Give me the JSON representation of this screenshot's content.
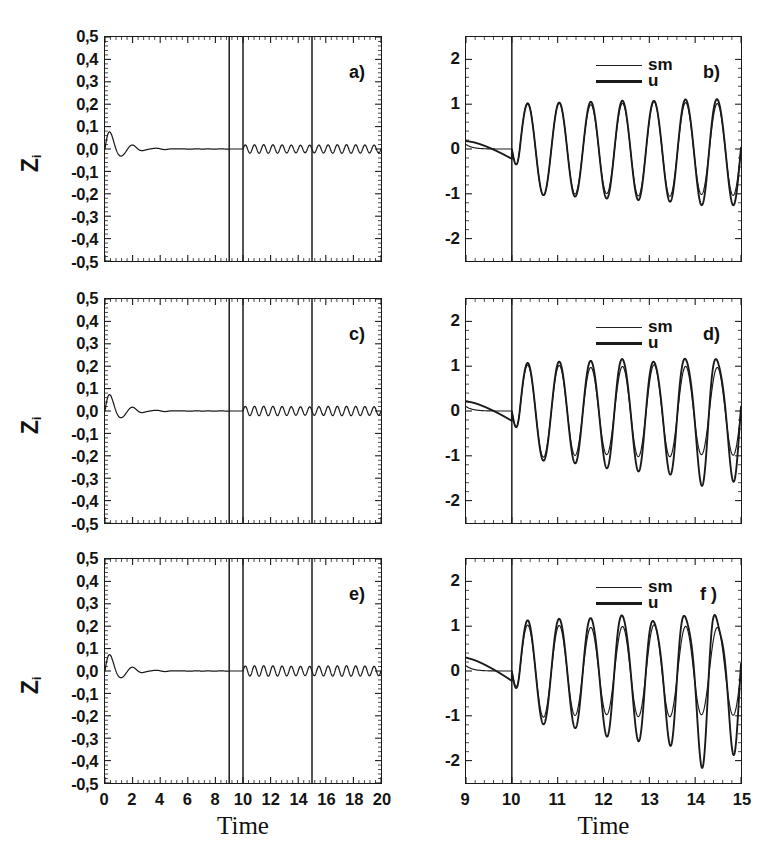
{
  "figure": {
    "background_color": "#ffffff",
    "line_color": "#1a1a1a",
    "panel_count": 6
  },
  "axis_titles": {
    "x_left": "Time",
    "x_right": "Time",
    "y_left_main": "Z",
    "y_left_sub": "i"
  },
  "legend": {
    "entries": [
      {
        "label": "sm",
        "style": "thin"
      },
      {
        "label": "u",
        "style": "thick"
      }
    ]
  },
  "panels": {
    "a": {
      "letter": "a)",
      "column": "left",
      "row": 1
    },
    "b": {
      "letter": "b)",
      "column": "right",
      "row": 1
    },
    "c": {
      "letter": "c)",
      "column": "left",
      "row": 2
    },
    "d": {
      "letter": "d)",
      "column": "right",
      "row": 2
    },
    "e": {
      "letter": "e)",
      "column": "left",
      "row": 3
    },
    "f": {
      "letter": "f )",
      "column": "right",
      "row": 3
    }
  },
  "axes_left": {
    "x_ticks": [
      "0",
      "2",
      "4",
      "6",
      "8",
      "10",
      "12",
      "14",
      "16",
      "18",
      "20"
    ],
    "x_tick_values": [
      0,
      2,
      4,
      6,
      8,
      10,
      12,
      14,
      16,
      18,
      20
    ],
    "xlim": [
      0,
      20
    ],
    "y_ticks": [
      "0,5",
      "0,4",
      "0,3",
      "0,2",
      "0,1",
      "0,0",
      "-0,1",
      "-0,2",
      "-0,3",
      "-0,4",
      "-0,5"
    ],
    "y_tick_values": [
      0.5,
      0.4,
      0.3,
      0.2,
      0.1,
      0.0,
      -0.1,
      -0.2,
      -0.3,
      -0.4,
      -0.5
    ],
    "ylim": [
      -0.5,
      0.5
    ],
    "minor_ticks_per_interval": 4
  },
  "axes_right": {
    "x_ticks": [
      "9",
      "10",
      "11",
      "12",
      "13",
      "14",
      "15"
    ],
    "x_tick_values": [
      9,
      10,
      11,
      12,
      13,
      14,
      15
    ],
    "xlim": [
      9,
      15
    ],
    "y_ticks": [
      "2",
      "1",
      "0",
      "-1",
      "-2"
    ],
    "y_tick_values": [
      2,
      1,
      0,
      -1,
      -2
    ],
    "ylim": [
      -2.5,
      2.5
    ],
    "minor_ticks_per_interval": 4
  },
  "chart_data": [
    {
      "id": "a",
      "type": "line",
      "title": "a)",
      "xlabel": "Time",
      "ylabel": "Z_i",
      "xlim": [
        0,
        20
      ],
      "ylim": [
        -0.5,
        0.5
      ],
      "grid": false,
      "legend_position": "none",
      "vertical_markers": [
        9,
        10,
        15
      ],
      "series": [
        {
          "name": "Z_i",
          "description": "Damped transient oscillation decaying to zero by t=5, flat until t=10, then small steady ripple of amplitude ~0.018 until t=20",
          "transient": {
            "amplitude": 0.105,
            "decay_rate": 0.95,
            "frequency_hz": 0.62,
            "phase": 0.0,
            "end_time": 9.0
          },
          "ripple": {
            "start_time": 10.0,
            "amplitude": 0.018,
            "frequency_hz": 1.5,
            "growth": 0.0
          },
          "x": [
            0,
            0.5,
            1.0,
            1.5,
            2.0,
            2.5,
            3.0,
            3.5,
            4.0,
            5.0,
            6.0,
            7.0,
            8.0,
            9.0,
            10.0,
            12.0,
            14.0,
            16.0,
            18.0,
            20.0
          ],
          "y": [
            0.0,
            0.095,
            -0.055,
            0.04,
            -0.022,
            0.018,
            -0.012,
            0.009,
            -0.006,
            0.004,
            -0.003,
            0.002,
            0.0,
            0.0,
            0.0,
            0.0,
            0.0,
            0.0,
            0.0,
            0.0
          ]
        }
      ]
    },
    {
      "id": "b",
      "type": "line",
      "title": "b)",
      "xlabel": "Time",
      "ylabel": "",
      "xlim": [
        9,
        15
      ],
      "ylim": [
        -2.5,
        2.5
      ],
      "grid": false,
      "legend_position": "upper-center",
      "vertical_markers": [
        10
      ],
      "series": [
        {
          "name": "sm",
          "description": "Reference sinusoid starting at t=10, amplitude approximately 1.0 with slight growth, frequency ~1.45 cycles per unit time",
          "amplitude_start": 1.0,
          "amplitude_end": 1.05,
          "frequency_hz": 1.45,
          "pre_start_value": 0.1
        },
        {
          "name": "u",
          "description": "Control signal tracking sm almost exactly; peaks reach about 1.15 and troughs about -1.2 near t=15 with small divergence at the end",
          "amplitude_start": 1.0,
          "amplitude_end": 1.2,
          "frequency_hz": 1.45,
          "pre_start_value": 0.18,
          "divergence": "minimal"
        }
      ]
    },
    {
      "id": "c",
      "type": "line",
      "title": "c)",
      "xlabel": "Time",
      "ylabel": "Z_i",
      "xlim": [
        0,
        20
      ],
      "ylim": [
        -0.5,
        0.5
      ],
      "grid": false,
      "legend_position": "none",
      "vertical_markers": [
        9,
        10,
        15
      ],
      "series": [
        {
          "name": "Z_i",
          "description": "Damped transient oscillation decaying to zero, flat until t=10, then steady ripple of amplitude ~0.02",
          "transient": {
            "amplitude": 0.1,
            "decay_rate": 0.95,
            "frequency_hz": 0.62,
            "phase": 0.0,
            "end_time": 9.0
          },
          "ripple": {
            "start_time": 10.0,
            "amplitude": 0.02,
            "frequency_hz": 1.5,
            "growth": 0.0
          },
          "x": [
            0,
            0.5,
            1.0,
            1.5,
            2.0,
            2.5,
            3.0,
            3.5,
            4.0,
            5.0,
            6.0,
            7.0,
            8.0,
            9.0,
            10.0,
            12.0,
            14.0,
            16.0,
            18.0,
            20.0
          ],
          "y": [
            0.0,
            0.09,
            -0.052,
            0.038,
            -0.021,
            0.017,
            -0.011,
            0.008,
            -0.006,
            0.004,
            -0.003,
            0.002,
            0.0,
            0.0,
            0.0,
            0.0,
            0.0,
            0.0,
            0.0,
            0.0
          ]
        }
      ]
    },
    {
      "id": "d",
      "type": "line",
      "title": "d)",
      "xlabel": "Time",
      "ylabel": "",
      "xlim": [
        9,
        15
      ],
      "ylim": [
        -2.5,
        2.5
      ],
      "grid": false,
      "legend_position": "upper-center",
      "vertical_markers": [
        10
      ],
      "series": [
        {
          "name": "sm",
          "description": "Reference sinusoid starting at t=10, amplitude approximately 1.0 held constant",
          "amplitude_start": 1.0,
          "amplitude_end": 1.0,
          "frequency_hz": 1.45,
          "pre_start_value": 0.1
        },
        {
          "name": "u",
          "description": "Control signal tracks sm but visibly diverges after t=13, peaks up to 1.3 and troughs down to -1.45 near t=14.5",
          "amplitude_start": 1.05,
          "amplitude_end": 1.4,
          "frequency_hz": 1.45,
          "pre_start_value": 0.22,
          "divergence": "moderate"
        }
      ]
    },
    {
      "id": "e",
      "type": "line",
      "title": "e)",
      "xlabel": "Time",
      "ylabel": "Z_i",
      "xlim": [
        0,
        20
      ],
      "ylim": [
        -0.5,
        0.5
      ],
      "grid": false,
      "legend_position": "none",
      "vertical_markers": [
        9,
        10,
        15
      ],
      "series": [
        {
          "name": "Z_i",
          "description": "Damped transient oscillation decaying to zero, flat until t=10, then steady ripple of amplitude ~0.022",
          "transient": {
            "amplitude": 0.1,
            "decay_rate": 0.95,
            "frequency_hz": 0.62,
            "phase": 0.0,
            "end_time": 9.0
          },
          "ripple": {
            "start_time": 10.0,
            "amplitude": 0.022,
            "frequency_hz": 1.5,
            "growth": 0.0
          },
          "x": [
            0,
            0.5,
            1.0,
            1.5,
            2.0,
            2.5,
            3.0,
            3.5,
            4.0,
            5.0,
            6.0,
            7.0,
            8.0,
            9.0,
            10.0,
            12.0,
            14.0,
            16.0,
            18.0,
            20.0
          ],
          "y": [
            0.0,
            0.092,
            -0.05,
            0.037,
            -0.02,
            0.016,
            -0.011,
            0.008,
            -0.005,
            0.003,
            -0.002,
            0.002,
            0.0,
            0.0,
            0.0,
            0.0,
            0.0,
            0.0,
            0.0,
            0.0
          ]
        }
      ]
    },
    {
      "id": "f",
      "type": "line",
      "title": "f )",
      "xlabel": "Time",
      "ylabel": "",
      "xlim": [
        9,
        15
      ],
      "ylim": [
        -2.5,
        2.5
      ],
      "grid": false,
      "legend_position": "upper-center",
      "vertical_markers": [
        10
      ],
      "series": [
        {
          "name": "sm",
          "description": "Reference sinusoid starting at t=10, amplitude approximately 1.0 held constant throughout",
          "amplitude_start": 1.0,
          "amplitude_end": 1.0,
          "frequency_hz": 1.45,
          "pre_start_value": 0.12
        },
        {
          "name": "u",
          "description": "Control signal diverges strongly from sm; peaks reach 1.45 near t=13.5 and troughs fall to -1.6 near t=14.3, with visible amplitude and phase mismatch",
          "amplitude_start": 1.1,
          "amplitude_end": 1.6,
          "frequency_hz": 1.45,
          "pre_start_value": 0.3,
          "divergence": "large"
        }
      ]
    }
  ]
}
